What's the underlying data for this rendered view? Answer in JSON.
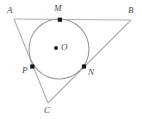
{
  "figure": {
    "kind": "geometry-diagram",
    "width": 142,
    "height": 119,
    "background_color": "#ffffff",
    "line_color": "#b0b0b0",
    "circle_color": "#9a9a9a",
    "label_color": "#4a4a4a",
    "marker_color": "#1a1a1a"
  },
  "points": {
    "A": {
      "label": "A",
      "x": 14,
      "y": 19,
      "label_x": 7,
      "label_y": 6,
      "marker": false
    },
    "B": {
      "label": "B",
      "x": 131,
      "y": 20,
      "label_x": 128,
      "label_y": 6,
      "marker": false
    },
    "C": {
      "label": "C",
      "x": 48,
      "y": 103,
      "label_x": 44,
      "label_y": 106,
      "marker": false
    },
    "M": {
      "label": "M",
      "x": 60,
      "y": 20,
      "label_x": 54,
      "label_y": 4,
      "marker": true
    },
    "N": {
      "label": "N",
      "x": 84,
      "y": 67,
      "label_x": 88,
      "label_y": 68,
      "marker": true
    },
    "P": {
      "label": "P",
      "x": 32,
      "y": 67,
      "label_x": 22,
      "label_y": 66,
      "marker": true
    },
    "O": {
      "label": "O",
      "x": 56,
      "y": 48,
      "label_x": 61,
      "label_y": 43,
      "marker": true
    }
  },
  "circle": {
    "center_x": 59,
    "center_y": 49,
    "radius": 30
  },
  "segments": [
    {
      "name": "side-AB",
      "from": "A",
      "to": "B"
    },
    {
      "name": "side-AC",
      "from": "A",
      "to": "C"
    },
    {
      "name": "side-BC",
      "from": "B",
      "to": "C"
    }
  ]
}
